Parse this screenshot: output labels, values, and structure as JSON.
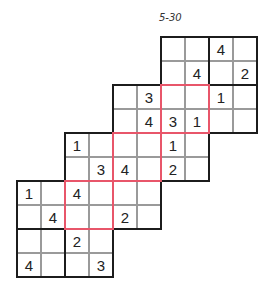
{
  "puzzle": {
    "title": "5-30",
    "type": "Overlapping 4x4 Sudoku staircase",
    "grid_origin": {
      "x": 17,
      "y": 37
    },
    "cell_size": 24,
    "colors": {
      "thick_border": "#1c1c1c",
      "thin_border": "#9a9a9a",
      "overlap_border": "#e8566a",
      "digit": "#222222"
    },
    "rows": [
      {
        "row": 0,
        "start_col": 6,
        "cells": [
          "",
          "",
          "4",
          ""
        ]
      },
      {
        "row": 1,
        "start_col": 6,
        "cells": [
          "",
          "4",
          "",
          "2"
        ]
      },
      {
        "row": 2,
        "start_col": 4,
        "cells": [
          "",
          "3",
          "",
          "",
          "1",
          ""
        ]
      },
      {
        "row": 3,
        "start_col": 4,
        "cells": [
          "",
          "4",
          "3",
          "1",
          "",
          ""
        ]
      },
      {
        "row": 4,
        "start_col": 2,
        "cells": [
          "1",
          "",
          "",
          "",
          "1",
          ""
        ]
      },
      {
        "row": 5,
        "start_col": 2,
        "cells": [
          "",
          "3",
          "4",
          "",
          "2",
          ""
        ]
      },
      {
        "row": 6,
        "start_col": 0,
        "cells": [
          "1",
          "",
          "4",
          "",
          "",
          ""
        ]
      },
      {
        "row": 7,
        "start_col": 0,
        "cells": [
          "",
          "4",
          "",
          "",
          "2",
          ""
        ]
      },
      {
        "row": 8,
        "start_col": 0,
        "cells": [
          "",
          "",
          "2",
          ""
        ]
      },
      {
        "row": 9,
        "start_col": 0,
        "cells": [
          "4",
          "",
          "",
          "3"
        ]
      }
    ],
    "sub_grids": [
      {
        "name": "grid-a",
        "col": 6,
        "row": 0
      },
      {
        "name": "grid-b",
        "col": 4,
        "row": 2
      },
      {
        "name": "grid-c",
        "col": 2,
        "row": 4
      },
      {
        "name": "grid-d",
        "col": 0,
        "row": 6
      }
    ],
    "overlap_boxes": [
      {
        "col": 6,
        "row": 2
      },
      {
        "col": 4,
        "row": 4
      },
      {
        "col": 2,
        "row": 6
      }
    ]
  }
}
